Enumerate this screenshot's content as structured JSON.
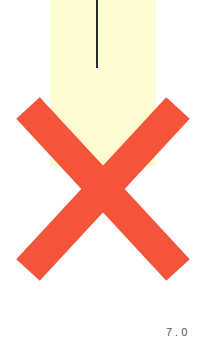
{
  "panel": {
    "color": "#fdfbd0"
  },
  "line": {
    "color": "#2a2a2a"
  },
  "cross": {
    "icon": "x-mark-icon",
    "color": "#f4553a"
  },
  "footer": {
    "label": "7.0"
  }
}
